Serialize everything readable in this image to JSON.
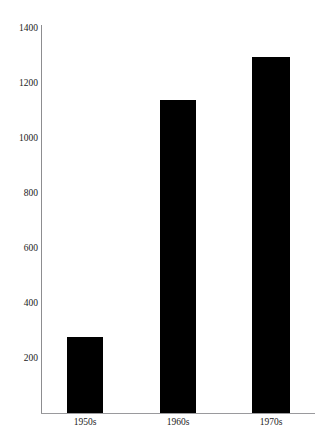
{
  "top_artifact_text": "                    ",
  "chart_data": {
    "type": "bar",
    "title": "",
    "subtitle": "",
    "xlabel": "",
    "ylabel": "",
    "categories": [
      "1950s",
      "1960s",
      "1970s"
    ],
    "values": [
      275,
      1140,
      1295
    ],
    "series": [
      {
        "name": "",
        "values": [
          275,
          1140,
          1295
        ]
      }
    ],
    "ylim": [
      0,
      1400
    ],
    "yticks": [
      200,
      400,
      600,
      800,
      1000,
      1200,
      1400
    ],
    "ytick_labels": [
      "200",
      "400",
      "600",
      "800",
      "1000",
      "1200",
      "1400"
    ],
    "xtick_labels": [
      "1950s",
      "1960s",
      "1970s"
    ],
    "grid": false,
    "legend": false,
    "legend_position": "none",
    "bar_color": "#000000",
    "axis_color": "#8d8d90",
    "background_color": "#ffffff",
    "annotations": []
  }
}
